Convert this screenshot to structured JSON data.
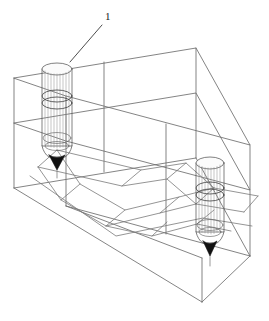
{
  "figure": {
    "kind": "isometric-wireframe-technical-drawing",
    "background_color": "#ffffff",
    "line_color": "#6e6e6e",
    "probe_line_color": "#4a4a4a",
    "tip_fill_color": "#111111",
    "label_color": "#1a1a1a"
  },
  "callouts": [
    {
      "id": "callout-1",
      "text": "1",
      "x": 106,
      "y": 14,
      "leader_from": [
        102,
        25
      ],
      "leader_to": [
        70,
        62
      ]
    }
  ],
  "block": {
    "name": "ground-block-wireframe",
    "description": "rectangular isometric box representing a soil/rock volume",
    "outer_vertices": {
      "top_back_left": [
        14,
        78
      ],
      "top_back_right": [
        196,
        48
      ],
      "top_front_right": [
        250,
        145
      ],
      "top_front_left": [
        66,
        96
      ],
      "bottom_back_left": [
        14,
        188
      ],
      "bottom_back_right": [
        196,
        158
      ],
      "bottom_front_right": [
        250,
        256
      ],
      "bottom_front_left": [
        66,
        206
      ]
    },
    "mid_plane_vertices": {
      "back_left": [
        14,
        123
      ],
      "back_right": [
        196,
        93
      ],
      "front_right": [
        250,
        190
      ],
      "front_left": [
        66,
        141
      ]
    },
    "lower_box_vertices": {
      "front_left": [
        66,
        206
      ],
      "front_right": [
        250,
        256
      ],
      "bottom_front": [
        202,
        302
      ],
      "bottom_left": [
        14,
        188
      ]
    }
  },
  "fold_surface": {
    "name": "folded-strata-surface",
    "description": "interior folded / faulted geological layer forming a trough (syncline)"
  },
  "probes": [
    {
      "id": "probe-left",
      "name": "cone-penetration-probe-left",
      "center_x": 57,
      "top_y": 63,
      "body_bottom_y": 146,
      "tip_y": 168,
      "radius_x": 15,
      "radius_y": 6,
      "band_y": 98,
      "segments": 14
    },
    {
      "id": "probe-right",
      "name": "cone-penetration-probe-right",
      "center_x": 210,
      "top_y": 157,
      "body_bottom_y": 232,
      "tip_y": 254,
      "radius_x": 14,
      "radius_y": 6,
      "band_y": 190,
      "segments": 14
    }
  ]
}
